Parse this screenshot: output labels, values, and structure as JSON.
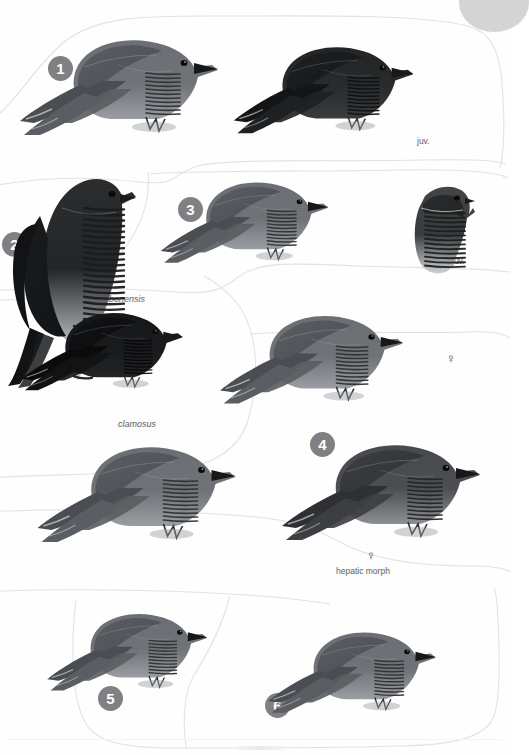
{
  "plate": {
    "kind": "field-guide-illustration-plate",
    "page_background": "#fefefe",
    "marker_color": "#808083",
    "marker_text_color": "#ffffff",
    "label_color": "#5d5d60",
    "divider_color": "#e2e2e4",
    "thumb_tab_color": "#d4d4d4"
  },
  "markers": [
    {
      "number": "1",
      "x": 48,
      "y": 56
    },
    {
      "number": "2",
      "x": 2,
      "y": 232
    },
    {
      "number": "3",
      "x": 178,
      "y": 197
    },
    {
      "number": "4",
      "x": 310,
      "y": 432
    },
    {
      "number": "5",
      "x": 98,
      "y": 686
    },
    {
      "number": "6",
      "x": 265,
      "y": 693
    }
  ],
  "labels": [
    {
      "text": "juv.",
      "x": 417,
      "y": 136,
      "style": "plain"
    },
    {
      "text": "gabonensis",
      "x": 99,
      "y": 294,
      "style": "italic"
    },
    {
      "text": "juv.",
      "x": 452,
      "y": 256,
      "style": "plain"
    },
    {
      "text": "♀",
      "x": 446,
      "y": 351,
      "style": "symbol"
    },
    {
      "text": "clamosus",
      "x": 118,
      "y": 419,
      "style": "italic"
    },
    {
      "text": "♂",
      "x": 160,
      "y": 468,
      "style": "symbol"
    },
    {
      "text": "♀",
      "x": 366,
      "y": 548,
      "style": "symbol"
    },
    {
      "text": "hepatic morph",
      "x": 336,
      "y": 566,
      "style": "plain"
    }
  ],
  "birds": [
    {
      "name": "cuckoo-adult-grey-perched",
      "x": 18,
      "y": 8,
      "w": 215,
      "h": 160,
      "variant": "grey",
      "dir": "right",
      "tail": "long-down-left",
      "perch": true,
      "scale": 1.0
    },
    {
      "name": "cuckoo-juvenile-dark-perched",
      "x": 232,
      "y": 18,
      "w": 195,
      "h": 145,
      "variant": "blackish",
      "dir": "right",
      "tail": "long-down-left",
      "perch": true,
      "scale": 0.95
    },
    {
      "name": "cuckoo-gabonensis-perched-upright",
      "x": 4,
      "y": 168,
      "w": 140,
      "h": 215,
      "variant": "barred-dark",
      "dir": "right",
      "tail": "long-down-left",
      "perch": true,
      "scale": 1.0
    },
    {
      "name": "cuckoo-grey-perched-mid",
      "x": 150,
      "y": 168,
      "w": 200,
      "h": 110,
      "variant": "grey",
      "dir": "right",
      "tail": "long-left",
      "perch": true,
      "scale": 0.92
    },
    {
      "name": "cuckoo-juvenile-barred-head-bust",
      "x": 405,
      "y": 178,
      "w": 72,
      "h": 100,
      "variant": "barred-bust",
      "dir": "right",
      "tail": "none",
      "perch": false,
      "scale": 1.0
    },
    {
      "name": "cuckoo-clamosus-black-perched",
      "x": 20,
      "y": 282,
      "w": 175,
      "h": 140,
      "variant": "black",
      "dir": "right",
      "tail": "long-down-left",
      "perch": true,
      "scale": 1.0
    },
    {
      "name": "cuckoo-female-grey-perched",
      "x": 210,
      "y": 300,
      "w": 215,
      "h": 120,
      "variant": "grey",
      "dir": "right",
      "tail": "long-left",
      "perch": true,
      "scale": 1.0
    },
    {
      "name": "cuckoo-male-grey-perched",
      "x": 28,
      "y": 430,
      "w": 230,
      "h": 130,
      "variant": "grey",
      "dir": "right",
      "tail": "long-left",
      "perch": true,
      "scale": 1.0
    },
    {
      "name": "cuckoo-hepatic-morph-perched",
      "x": 280,
      "y": 418,
      "w": 215,
      "h": 150,
      "variant": "hepatic",
      "dir": "right",
      "tail": "long-down-left",
      "perch": true,
      "scale": 1.0
    },
    {
      "name": "cuckoo-species-5-perched",
      "x": 30,
      "y": 600,
      "w": 205,
      "h": 105,
      "variant": "grey",
      "dir": "right",
      "tail": "long-left",
      "perch": true,
      "scale": 0.95
    },
    {
      "name": "cuckoo-species-6-perched",
      "x": 250,
      "y": 618,
      "w": 215,
      "h": 110,
      "variant": "grey",
      "dir": "right",
      "tail": "long-left",
      "perch": true,
      "scale": 0.95
    }
  ]
}
